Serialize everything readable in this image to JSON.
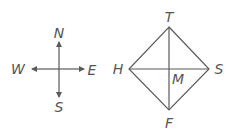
{
  "compass": {
    "north": "N",
    "south": "S",
    "west": "W",
    "east": "E"
  },
  "figure": {
    "vertices": {
      "top": "T",
      "left": "H",
      "right": "S",
      "bottom": "F"
    },
    "center": "M"
  },
  "colors": {
    "line": "#5a5a5a",
    "label": "#555555"
  }
}
